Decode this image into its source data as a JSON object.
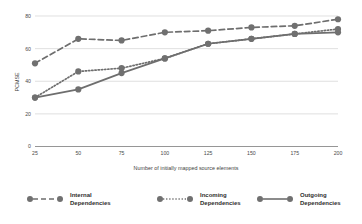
{
  "chart_data": {
    "type": "line",
    "title": "",
    "xlabel": "Number of initially mapped source elements",
    "ylabel": "PCMSE",
    "x": [
      25,
      50,
      75,
      100,
      125,
      150,
      175,
      200
    ],
    "xticklabels": [
      "25",
      "50",
      "75",
      "100",
      "125",
      "150",
      "175",
      "200"
    ],
    "yticklabels": [
      "0",
      "20",
      "40",
      "60",
      "80"
    ],
    "yticks": [
      0,
      20,
      40,
      60,
      80
    ],
    "ylim": [
      0,
      84
    ],
    "xlim": [
      25,
      200
    ],
    "grid": "horizontal",
    "legend_position": "bottom",
    "series": [
      {
        "name": "Internal Dependencies",
        "style": "dashed",
        "values": [
          51,
          66,
          65,
          70,
          71,
          73,
          74,
          78
        ]
      },
      {
        "name": "Incoming Dependencies",
        "style": "dotted",
        "values": [
          30,
          46,
          48,
          54,
          63,
          66,
          69,
          72
        ]
      },
      {
        "name": "Outgoing Dependencies",
        "style": "solid",
        "values": [
          30,
          35,
          45,
          54,
          63,
          66,
          69,
          70
        ]
      }
    ]
  },
  "legend": {
    "items": [
      {
        "label_line1": "Internal",
        "label_line2": "Dependencies",
        "style": "dashed"
      },
      {
        "label_line1": "Incoming",
        "label_line2": "Dependencies",
        "style": "dotted"
      },
      {
        "label_line1": "Outgoing",
        "label_line2": "Dependencies",
        "style": "solid"
      }
    ]
  },
  "colors": {
    "series": "#6e6e6e",
    "marker": "#707070",
    "grid": "#d2d2d2",
    "axis": "#8a8a8a",
    "text": "#3b3b3b",
    "background": "#ffffff"
  }
}
